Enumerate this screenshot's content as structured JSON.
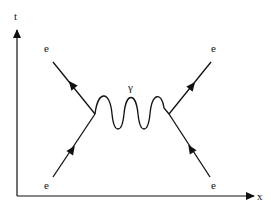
{
  "diagram": {
    "type": "feynman",
    "axes": {
      "vertical_label": "t",
      "horizontal_label": "x"
    },
    "photon_label": "γ",
    "particles": {
      "top_left": "e",
      "top_right": "e",
      "bottom_left": "e",
      "bottom_right": "e"
    },
    "colors": {
      "line": "#111111",
      "background": "#ffffff"
    }
  }
}
